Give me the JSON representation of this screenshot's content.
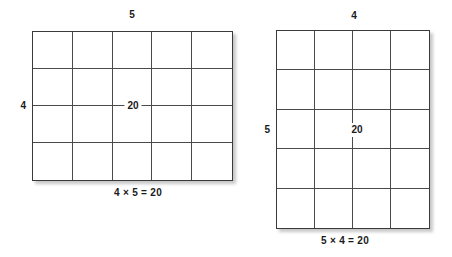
{
  "diagram": {
    "figures": [
      {
        "id": "left",
        "top_label": "5",
        "side_label": "4",
        "center_value": "20",
        "caption": "4 × 5 = 20",
        "columns": 5,
        "rows": 4
      },
      {
        "id": "right",
        "top_label": "4",
        "side_label": "5",
        "center_value": "20",
        "caption": "5 × 4 = 20",
        "columns": 4,
        "rows": 5
      }
    ]
  },
  "chart_data": {
    "type": "table",
    "arrays": [
      {
        "name": "4 by 5 array",
        "columns": 5,
        "rows": 4,
        "total": 20,
        "width_label": "5",
        "height_label": "4",
        "equation": "4 × 5 = 20"
      },
      {
        "name": "5 by 4 array",
        "columns": 4,
        "rows": 5,
        "total": 20,
        "width_label": "4",
        "height_label": "5",
        "equation": "5 × 4 = 20"
      }
    ],
    "grid": true,
    "legend": "none",
    "colors": {
      "stroke": "#4a4a4a",
      "text": "#1a1a1a",
      "background": "#ffffff"
    }
  }
}
